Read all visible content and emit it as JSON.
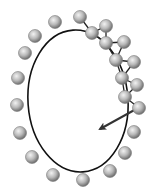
{
  "diagram": {
    "colors": {
      "background": "#ffffff",
      "path": "#111111",
      "sphere_light": "#f2f2f2",
      "sphere_mid": "#b8b8b8",
      "sphere_dark": "#6e6e6e",
      "link": "#222222",
      "arrow": "#333333"
    },
    "ellipse": {
      "cx": 78,
      "cy": 101,
      "rx": 50,
      "ry": 71,
      "rotate": -4
    },
    "sphere_radius": 6.5,
    "free_spheres": [
      {
        "x": 80,
        "y": 17
      },
      {
        "x": 55,
        "y": 22
      },
      {
        "x": 35,
        "y": 36
      },
      {
        "x": 25,
        "y": 53
      },
      {
        "x": 18,
        "y": 78
      },
      {
        "x": 17,
        "y": 105
      },
      {
        "x": 20,
        "y": 133
      },
      {
        "x": 32,
        "y": 157
      },
      {
        "x": 53,
        "y": 175
      },
      {
        "x": 83,
        "y": 180
      },
      {
        "x": 110,
        "y": 171
      },
      {
        "x": 125,
        "y": 153
      },
      {
        "x": 134,
        "y": 132
      }
    ],
    "chain_spheres": [
      {
        "x": 92,
        "y": 33
      },
      {
        "x": 106,
        "y": 26
      },
      {
        "x": 106,
        "y": 43
      },
      {
        "x": 124,
        "y": 42
      },
      {
        "x": 116,
        "y": 60
      },
      {
        "x": 134,
        "y": 62
      },
      {
        "x": 122,
        "y": 78
      },
      {
        "x": 137,
        "y": 85
      },
      {
        "x": 125,
        "y": 97
      },
      {
        "x": 139,
        "y": 108
      }
    ],
    "chain_links": [
      [
        80,
        17,
        92,
        33
      ],
      [
        92,
        33,
        106,
        26
      ],
      [
        92,
        33,
        106,
        43
      ],
      [
        106,
        26,
        106,
        43
      ],
      [
        106,
        43,
        124,
        42
      ],
      [
        106,
        43,
        116,
        60
      ],
      [
        124,
        42,
        116,
        60
      ],
      [
        116,
        60,
        134,
        62
      ],
      [
        116,
        60,
        122,
        78
      ],
      [
        134,
        62,
        122,
        78
      ],
      [
        122,
        78,
        137,
        85
      ],
      [
        122,
        78,
        125,
        97
      ],
      [
        137,
        85,
        125,
        97
      ],
      [
        125,
        97,
        139,
        108
      ]
    ],
    "arrow": {
      "x1": 138,
      "y1": 108,
      "x2": 100,
      "y2": 129
    }
  }
}
